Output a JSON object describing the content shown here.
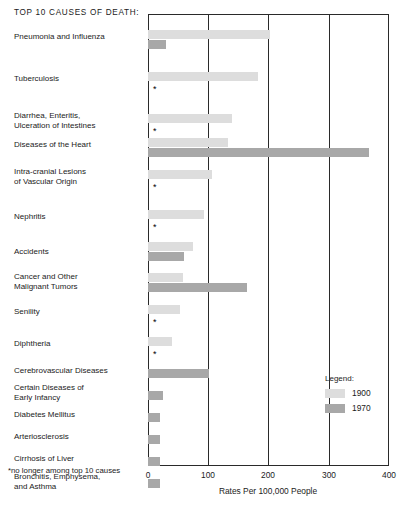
{
  "title": "TOP 10 CAUSES OF DEATH:",
  "footnote": "*no longer among top 10 causes",
  "legend": {
    "heading": "Legend:",
    "entries": [
      {
        "label": "1900",
        "color": "#dddddd"
      },
      {
        "label": "1970",
        "color": "#a8a8a8"
      }
    ]
  },
  "axis": {
    "xlabel": "Rates Per 100,000 People",
    "ticks": [
      "0",
      "100",
      "200",
      "300",
      "400"
    ]
  },
  "chart_data": {
    "type": "bar",
    "orientation": "horizontal",
    "title": "TOP 10 CAUSES OF DEATH:",
    "xlabel": "Rates Per 100,000 People",
    "ylabel": "",
    "xlim": [
      0,
      400
    ],
    "xticks": [
      0,
      100,
      200,
      300,
      400
    ],
    "grid": "vertical",
    "legend_position": "inside-right-lower",
    "categories": [
      "Pneumonia and Influenza",
      "Tuberculosis",
      "Diarrhea, Enteritis,\nUlceration of Intestines",
      "Diseases of the Heart",
      "Intra-cranial Lesions\nof Vascular Origin",
      "Nephritis",
      "Accidents",
      "Cancer and Other\nMalignant Tumors",
      "Senility",
      "Diphtheria",
      "Cerebrovascular Diseases",
      "Certain Diseases of\nEarly Infancy",
      "Diabetes Mellitus",
      "Arteriosclerosis",
      "Cirrhosis of Liver",
      "Bronchitis, Emphysema,\nand Asthma"
    ],
    "series": [
      {
        "name": "1900",
        "color": "#dddddd",
        "values": [
          202,
          183,
          140,
          133,
          106,
          93,
          75,
          58,
          53,
          40,
          null,
          null,
          null,
          null,
          null,
          null
        ]
      },
      {
        "name": "1970",
        "color": "#a8a8a8",
        "values": [
          30,
          0,
          0,
          366,
          0,
          0,
          60,
          165,
          0,
          0,
          101,
          25,
          20,
          20,
          20,
          20
        ]
      }
    ],
    "no_longer_top10_marker": "*"
  },
  "rows": [
    {
      "label": "Pneumonia and Influenza",
      "v1900": 202,
      "v1970": 30,
      "star1970": false,
      "top": 16,
      "label_top": 18,
      "lines": 1
    },
    {
      "label": "Tuberculosis",
      "v1900": 183,
      "v1970": null,
      "star1970": true,
      "top": 58,
      "label_top": 60,
      "lines": 1
    },
    {
      "label": "Diarrhea, Enteritis,\nUlceration of Intestines",
      "v1900": 140,
      "v1970": null,
      "star1970": true,
      "top": 100,
      "label_top": 97,
      "lines": 2
    },
    {
      "label": "Diseases of the Heart",
      "v1900": 133,
      "v1970": 366,
      "star1970": false,
      "top": 124,
      "label_top": 126,
      "lines": 1
    },
    {
      "label": "Intra-cranial Lesions\nof Vascular Origin",
      "v1900": 106,
      "v1970": null,
      "star1970": true,
      "top": 156,
      "label_top": 153,
      "lines": 2
    },
    {
      "label": "Nephritis",
      "v1900": 93,
      "v1970": null,
      "star1970": true,
      "top": 196,
      "label_top": 198,
      "lines": 1
    },
    {
      "label": "Accidents",
      "v1900": 75,
      "v1970": 60,
      "star1970": false,
      "top": 228,
      "label_top": 233,
      "lines": 1
    },
    {
      "label": "Cancer and Other\nMalignant Tumors",
      "v1900": 58,
      "v1970": 165,
      "star1970": false,
      "top": 259,
      "label_top": 258,
      "lines": 2
    },
    {
      "label": "Senility",
      "v1900": 53,
      "v1970": null,
      "star1970": true,
      "top": 291,
      "label_top": 293,
      "lines": 1
    },
    {
      "label": "Diphtheria",
      "v1900": 40,
      "v1970": null,
      "star1970": true,
      "top": 323,
      "label_top": 325,
      "lines": 1
    },
    {
      "label": "Cerebrovascular Diseases",
      "v1900": null,
      "v1970": 101,
      "star1970": false,
      "top": 355,
      "label_top": 352,
      "lines": 1
    },
    {
      "label": "Certain Diseases of\nEarly Infancy",
      "v1900": null,
      "v1970": 25,
      "star1970": false,
      "top": 377,
      "label_top": 369,
      "lines": 2
    },
    {
      "label": "Diabetes Mellitus",
      "v1900": null,
      "v1970": 20,
      "star1970": false,
      "top": 399,
      "label_top": 396,
      "lines": 1
    },
    {
      "label": "Arteriosclerosis",
      "v1900": null,
      "v1970": 20,
      "star1970": false,
      "top": 421,
      "label_top": 418,
      "lines": 1
    },
    {
      "label": "Cirrhosis of Liver",
      "v1900": null,
      "v1970": 20,
      "star1970": false,
      "top": 443,
      "label_top": 440,
      "lines": 1
    },
    {
      "label": "Bronchitis, Emphysema,\nand Asthma",
      "v1900": null,
      "v1970": 20,
      "star1970": false,
      "top": 465,
      "label_top": 458,
      "lines": 2
    }
  ]
}
